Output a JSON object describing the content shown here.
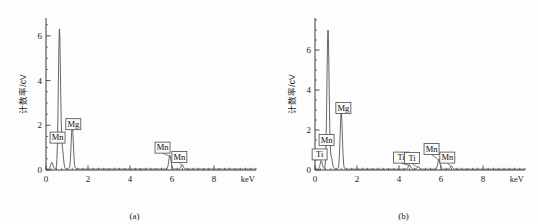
{
  "figure": {
    "panels": [
      {
        "caption": "(a)",
        "chart_index": 0
      },
      {
        "caption": "(b)",
        "chart_index": 1
      }
    ]
  },
  "chart_data": [
    {
      "type": "line",
      "title": "",
      "subtitle": "",
      "caption": "(a)",
      "xlabel": "keV",
      "ylabel": "计数率/cV",
      "xlim": [
        0,
        10
      ],
      "ylim": [
        0,
        6.8
      ],
      "xticks": [
        0,
        2,
        4,
        6,
        8
      ],
      "xtick_labels": [
        "0",
        "2",
        "4",
        "6",
        "8"
      ],
      "yticks": [
        0,
        2,
        4,
        6
      ],
      "ytick_labels": [
        "0",
        "2",
        "4",
        "6"
      ],
      "x_minor_interval": 0.25,
      "y_minor_interval": 0.5,
      "grid": false,
      "legend": "none",
      "peaks": [
        {
          "label": "",
          "energy_keV": 0.28,
          "height": 0.3
        },
        {
          "label": "Mn",
          "energy_keV": 0.64,
          "height": 6.25
        },
        {
          "label": "",
          "energy_keV": 0.78,
          "height": 0.82
        },
        {
          "label": "Mg",
          "energy_keV": 1.25,
          "height": 1.92
        },
        {
          "label": "Mn",
          "energy_keV": 5.9,
          "height": 0.62
        },
        {
          "label": "Mn",
          "energy_keV": 6.49,
          "height": 0.18
        }
      ],
      "annotations": [
        {
          "text": "Mn",
          "energy_keV": 0.64,
          "box_x": 0.55,
          "box_y": 1.45
        },
        {
          "text": "Mg",
          "energy_keV": 1.25,
          "box_x": 1.3,
          "box_y": 2.05
        },
        {
          "text": "Mn",
          "energy_keV": 5.9,
          "box_x": 5.55,
          "box_y": 1.0
        },
        {
          "text": "Mn",
          "energy_keV": 6.49,
          "box_x": 6.35,
          "box_y": 0.58
        }
      ],
      "baseline": 0.045
    },
    {
      "type": "line",
      "title": "",
      "subtitle": "",
      "caption": "(b)",
      "xlabel": "keV",
      "ylabel": "计数率/cV",
      "xlim": [
        0,
        10
      ],
      "ylim": [
        0,
        7.6
      ],
      "xticks": [
        0,
        2,
        4,
        6,
        8
      ],
      "xtick_labels": [
        "0",
        "2",
        "4",
        "6",
        "8"
      ],
      "yticks": [
        0,
        2,
        4,
        6
      ],
      "ytick_labels": [
        "0",
        "2",
        "4",
        "6"
      ],
      "x_minor_interval": 0.25,
      "y_minor_interval": 0.5,
      "grid": false,
      "legend": "none",
      "peaks": [
        {
          "label": "Ti",
          "energy_keV": 0.3,
          "height": 0.42
        },
        {
          "label": "Mn",
          "energy_keV": 0.62,
          "height": 6.95
        },
        {
          "label": "",
          "energy_keV": 0.78,
          "height": 0.55
        },
        {
          "label": "Mg",
          "energy_keV": 1.25,
          "height": 2.85
        },
        {
          "label": "Ti",
          "energy_keV": 4.5,
          "height": 0.22
        },
        {
          "label": "Ti",
          "energy_keV": 4.92,
          "height": 0.12
        },
        {
          "label": "Mn",
          "energy_keV": 5.9,
          "height": 0.5
        },
        {
          "label": "Mn",
          "energy_keV": 6.49,
          "height": 0.16
        }
      ],
      "annotations": [
        {
          "text": "Ti",
          "energy_keV": 0.3,
          "box_x": 0.22,
          "box_y": 0.78
        },
        {
          "text": "Mn",
          "energy_keV": 0.62,
          "box_x": 0.55,
          "box_y": 1.5
        },
        {
          "text": "Mg",
          "energy_keV": 1.25,
          "box_x": 1.35,
          "box_y": 3.1
        },
        {
          "text": "Ti",
          "energy_keV": 4.5,
          "box_x": 4.1,
          "box_y": 0.62
        },
        {
          "text": "Ti",
          "energy_keV": 4.92,
          "box_x": 4.62,
          "box_y": 0.6
        },
        {
          "text": "Mn",
          "energy_keV": 5.9,
          "box_x": 5.55,
          "box_y": 1.05
        },
        {
          "text": "Mn",
          "energy_keV": 6.49,
          "box_x": 6.3,
          "box_y": 0.62
        }
      ],
      "baseline": 0.045
    }
  ],
  "colors": {
    "background": "#fdfdfd",
    "axis": "#3a3a3a",
    "trace": "#4a4a4a",
    "text": "#1c1c1c",
    "box_fill": "#fbfbfb"
  }
}
